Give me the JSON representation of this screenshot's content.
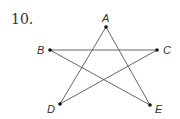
{
  "problem": {
    "number": "10."
  },
  "diagram": {
    "type": "pentagram",
    "line_color": "#555555",
    "points": [
      {
        "label": "A",
        "x": 106,
        "y": 27,
        "lx": 102,
        "ly": 22
      },
      {
        "label": "B",
        "x": 50,
        "y": 50,
        "lx": 37,
        "ly": 54
      },
      {
        "label": "C",
        "x": 157,
        "y": 50,
        "lx": 163,
        "ly": 54
      },
      {
        "label": "D",
        "x": 60,
        "y": 104,
        "lx": 47,
        "ly": 113
      },
      {
        "label": "E",
        "x": 150,
        "y": 105,
        "lx": 155,
        "ly": 113
      }
    ],
    "segments": [
      [
        "A",
        "D"
      ],
      [
        "A",
        "E"
      ],
      [
        "B",
        "C"
      ],
      [
        "B",
        "E"
      ],
      [
        "C",
        "D"
      ]
    ]
  }
}
